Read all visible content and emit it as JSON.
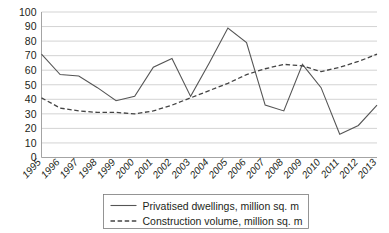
{
  "chart_data": {
    "type": "line",
    "title": "",
    "subtitle": "",
    "xlabel": "",
    "ylabel": "",
    "ylim": [
      0,
      100
    ],
    "ytick_step": 10,
    "grid": true,
    "legend_position": "bottom",
    "categories": [
      "1995",
      "1996",
      "1997",
      "1998",
      "1999",
      "2000",
      "2001",
      "2002",
      "2003",
      "2004",
      "2005",
      "2006",
      "2007",
      "2008",
      "2009",
      "2010",
      "2011",
      "2012",
      "2013"
    ],
    "yticks": [
      "0",
      "10",
      "20",
      "30",
      "40",
      "50",
      "60",
      "70",
      "80",
      "90",
      "100"
    ],
    "series": [
      {
        "name": "Privatised dwellings, million sq. m",
        "style": "solid",
        "color": "#555555",
        "values": [
          71,
          57,
          56,
          48,
          39,
          42,
          62,
          68,
          42,
          65,
          89,
          79,
          36,
          32,
          64,
          48,
          16,
          22,
          36
        ]
      },
      {
        "name": "Construction volume, million sq. m",
        "style": "dashed",
        "color": "#444444",
        "values": [
          41,
          34,
          32,
          31,
          31,
          30,
          32,
          36,
          41,
          46,
          51,
          57,
          61,
          64,
          63,
          59,
          62,
          66,
          71
        ]
      }
    ]
  },
  "colors": {
    "background": "#ffffff",
    "gridline": "#c8c8c8",
    "axis": "#9a9a9a",
    "text": "#231f20",
    "legend_border": "#7a7a7a"
  }
}
